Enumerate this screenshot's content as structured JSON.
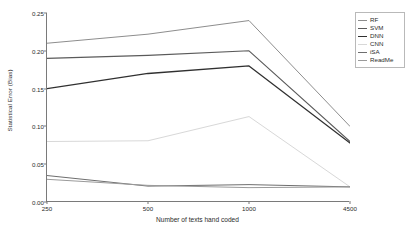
{
  "chart_data": {
    "type": "line",
    "title": "",
    "xlabel": "Number of texts hand coded",
    "ylabel": "Statistical Error (Bias)",
    "x": [
      250,
      500,
      1000,
      4500
    ],
    "xticklabels": [
      "250",
      "500",
      "1000",
      "4500"
    ],
    "yticklabels": [
      "0.00",
      "0.05",
      "0.10",
      "0.15",
      "0.20",
      "0.25"
    ],
    "ytickvalues": [
      0.0,
      0.05,
      0.1,
      0.15,
      0.2,
      0.25
    ],
    "ylim": [
      0.0,
      0.25
    ],
    "xlim_categorical": true,
    "grid": false,
    "legend_position": "top-right",
    "series": [
      {
        "name": "RF",
        "values": [
          0.21,
          0.222,
          0.24,
          0.1
        ],
        "color": "#8d8d8d",
        "width": 1.0
      },
      {
        "name": "SVM",
        "values": [
          0.19,
          0.194,
          0.2,
          0.08
        ],
        "color": "#5a5a5a",
        "width": 1.1
      },
      {
        "name": "DNN",
        "values": [
          0.15,
          0.17,
          0.18,
          0.078
        ],
        "color": "#303030",
        "width": 1.3
      },
      {
        "name": "CNN",
        "values": [
          0.08,
          0.081,
          0.113,
          0.02
        ],
        "color": "#d8d8d8",
        "width": 1.0
      },
      {
        "name": "iSA",
        "values": [
          0.035,
          0.021,
          0.023,
          0.02
        ],
        "color": "#6e6e6e",
        "width": 1.0
      },
      {
        "name": "ReadMe",
        "values": [
          0.03,
          0.022,
          0.019,
          0.02
        ],
        "color": "#9a9a9a",
        "width": 1.0
      }
    ]
  },
  "legend": {
    "items": [
      {
        "label": "RF"
      },
      {
        "label": "SVM"
      },
      {
        "label": "DNN"
      },
      {
        "label": "CNN"
      },
      {
        "label": "iSA"
      },
      {
        "label": "ReadMe"
      }
    ]
  },
  "axes": {
    "axis_color": "#7a7a7a",
    "text_color": "#2b2b2b"
  }
}
